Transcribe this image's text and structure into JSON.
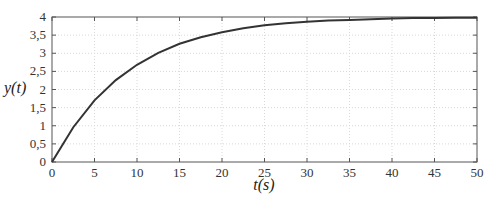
{
  "chart_data": {
    "type": "line",
    "title": "",
    "xlabel": "t(s)",
    "ylabel": "y(t)",
    "xlim": [
      0,
      50
    ],
    "ylim": [
      0,
      4
    ],
    "xticks": [
      0,
      5,
      10,
      15,
      20,
      25,
      30,
      35,
      40,
      45,
      50
    ],
    "yticks": [
      0,
      0.5,
      1,
      1.5,
      2,
      2.5,
      3,
      3.5,
      4
    ],
    "xtick_labels": [
      "0",
      "5",
      "10",
      "15",
      "20",
      "25",
      "30",
      "35",
      "40",
      "45",
      "50"
    ],
    "ytick_labels": [
      "0",
      "0,5",
      "1",
      "1,5",
      "2",
      "2,5",
      "3",
      "3,5",
      "4"
    ],
    "grid": true,
    "legend": null,
    "series": [
      {
        "name": "y(t)",
        "color": "#333333",
        "x": [
          0,
          2.5,
          5,
          7.5,
          10,
          12.5,
          15,
          17.5,
          20,
          22.5,
          25,
          27.5,
          30,
          32.5,
          35,
          37.5,
          40,
          42.5,
          45,
          47.5,
          50
        ],
        "values": [
          0,
          0.96,
          1.7,
          2.26,
          2.68,
          3.01,
          3.26,
          3.44,
          3.58,
          3.69,
          3.77,
          3.83,
          3.87,
          3.9,
          3.92,
          3.94,
          3.96,
          3.97,
          3.97,
          3.98,
          3.98
        ]
      }
    ]
  }
}
